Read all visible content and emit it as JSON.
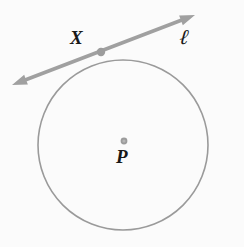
{
  "figure": {
    "type": "geometry-diagram",
    "background_color": "#fbfbfb",
    "stroke_color": "#9a9a9a",
    "line_color": "#a0a0a0",
    "point_color": "#9c9c9c",
    "label_color": "#181818",
    "labels": {
      "tangent_point": "X",
      "center": "P",
      "line": "ℓ"
    },
    "circle": {
      "center_x": 123,
      "center_y": 145,
      "radius": 85,
      "stroke_width": 1.6
    },
    "center_point": {
      "x": 124,
      "y": 141,
      "radius": 3.4
    },
    "tangent_point": {
      "x": 101,
      "y": 52,
      "radius": 4.2
    },
    "tangent_line": {
      "x1": 12,
      "y1": 85,
      "x2": 195,
      "y2": 15,
      "stroke_width": 3.6,
      "arrowheads": "both"
    }
  }
}
